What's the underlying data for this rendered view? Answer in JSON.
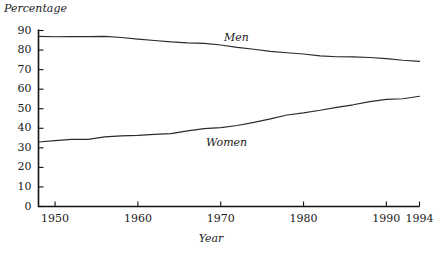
{
  "chart_data": {
    "type": "line",
    "title": "",
    "xlabel": "Year",
    "ylabel": "Percentage",
    "xlim": [
      1948,
      1994
    ],
    "ylim": [
      0,
      90
    ],
    "grid": false,
    "legend_position": "inline-annotation",
    "y_ticks": [
      0,
      10,
      20,
      30,
      40,
      50,
      60,
      70,
      80,
      90
    ],
    "y_tick_labels": [
      "0",
      "10",
      "20",
      "30",
      "40",
      "50",
      "60",
      "70",
      "80",
      "90"
    ],
    "x_ticks": [
      1950,
      1960,
      1970,
      1980,
      1990,
      1994
    ],
    "x_tick_labels": [
      "1950",
      "1960",
      "1970",
      "1980",
      "1990",
      "1994"
    ],
    "x": [
      1948,
      1950,
      1952,
      1954,
      1956,
      1958,
      1960,
      1962,
      1964,
      1966,
      1968,
      1970,
      1972,
      1974,
      1976,
      1978,
      1980,
      1982,
      1984,
      1986,
      1988,
      1990,
      1992,
      1994
    ],
    "series": [
      {
        "name": "Men",
        "label": "Men",
        "color": "#2b2b2b",
        "values": [
          87.0,
          86.8,
          86.9,
          86.9,
          87.0,
          86.4,
          85.6,
          84.9,
          84.2,
          83.7,
          83.4,
          82.6,
          81.4,
          80.4,
          79.3,
          78.6,
          78.0,
          77.0,
          76.6,
          76.5,
          76.2,
          75.6,
          74.8,
          74.2
        ]
      },
      {
        "name": "Women",
        "label": "Women",
        "color": "#2b2b2b",
        "values": [
          33.0,
          33.7,
          34.3,
          34.3,
          35.6,
          36.1,
          36.4,
          36.9,
          37.3,
          38.7,
          39.8,
          40.3,
          41.4,
          43.0,
          44.8,
          46.8,
          47.9,
          49.2,
          50.7,
          52.0,
          53.6,
          54.8,
          55.1,
          56.4
        ]
      }
    ]
  }
}
